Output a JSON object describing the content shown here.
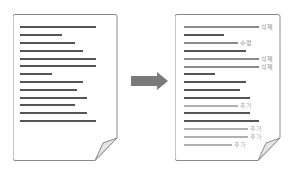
{
  "colors": {
    "frame": "#8a8a8a",
    "line_dark": "#555555",
    "line_gray": "#8c8c8c",
    "line_light": "#b0b0b0",
    "label_gray": "#8c8c8c",
    "label_light": "#aaaaaa",
    "arrow": "#7a7a7a",
    "fold": "#e4e4e4"
  },
  "original_document": {
    "lines": [
      {
        "y": 26,
        "end": 96
      },
      {
        "y": 34,
        "end": 62
      },
      {
        "y": 42,
        "end": 75
      },
      {
        "y": 50,
        "end": 83
      },
      {
        "y": 58,
        "end": 96
      },
      {
        "y": 65,
        "end": 96
      },
      {
        "y": 73,
        "end": 52
      },
      {
        "y": 81,
        "end": 83
      },
      {
        "y": 89,
        "end": 77
      },
      {
        "y": 97,
        "end": 87
      },
      {
        "y": 104,
        "end": 75
      },
      {
        "y": 112,
        "end": 87
      },
      {
        "y": 120,
        "end": 96
      }
    ]
  },
  "arrow": {
    "direction": "right"
  },
  "revised_document": {
    "lines": [
      {
        "y": 26,
        "end": 259,
        "style": "gray",
        "label": "삭제"
      },
      {
        "y": 34,
        "end": 224,
        "style": "dark",
        "label": ""
      },
      {
        "y": 42,
        "end": 238,
        "style": "gray",
        "label": "수정"
      },
      {
        "y": 50,
        "end": 246,
        "style": "dark",
        "label": ""
      },
      {
        "y": 58,
        "end": 259,
        "style": "gray",
        "label": "삭제"
      },
      {
        "y": 66,
        "end": 259,
        "style": "gray",
        "label": "삭제"
      },
      {
        "y": 73,
        "end": 215,
        "style": "dark",
        "label": ""
      },
      {
        "y": 81,
        "end": 246,
        "style": "dark",
        "label": ""
      },
      {
        "y": 89,
        "end": 240,
        "style": "dark",
        "label": ""
      },
      {
        "y": 97,
        "end": 250,
        "style": "dark",
        "label": ""
      },
      {
        "y": 105,
        "end": 238,
        "style": "light",
        "label": "추가"
      },
      {
        "y": 112,
        "end": 250,
        "style": "dark",
        "label": ""
      },
      {
        "y": 120,
        "end": 259,
        "style": "dark",
        "label": ""
      },
      {
        "y": 128,
        "end": 248,
        "style": "light",
        "label": "추가"
      },
      {
        "y": 136,
        "end": 248,
        "style": "light",
        "label": "추가"
      },
      {
        "y": 144,
        "end": 232,
        "style": "light",
        "label": "추가"
      }
    ]
  }
}
